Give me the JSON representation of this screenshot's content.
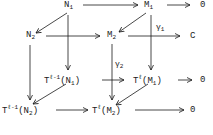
{
  "diagram": {
    "type": "commutative-cube",
    "nodes": {
      "N1": {
        "base": "N",
        "sub": "1"
      },
      "M1": {
        "base": "M",
        "sub": "1"
      },
      "Z1": {
        "base": "0"
      },
      "N2": {
        "base": "N",
        "sub": "2"
      },
      "M2": {
        "base": "M",
        "sub": "2"
      },
      "Z2": {
        "base": "C"
      },
      "TN1": {
        "base": "T",
        "sup": "ℓ-1",
        "arg": "(N",
        "argsub": "1",
        "close": ")"
      },
      "TM1": {
        "base": "T",
        "sup": "ℓ",
        "arg": "(M",
        "argsub": "1",
        "close": ")"
      },
      "Z3": {
        "base": "0"
      },
      "TN2": {
        "base": "T",
        "sup": "ℓ-1",
        "arg": "(N",
        "argsub": "2",
        "close": ")"
      },
      "TM2": {
        "base": "T",
        "sup": "ℓ",
        "arg": "(M",
        "argsub": "2",
        "close": ")"
      },
      "Z4": {
        "base": "0"
      }
    },
    "labels": {
      "gamma1": {
        "base": "γ",
        "sub": "1"
      },
      "gamma2": {
        "base": "γ",
        "sub": "2"
      }
    },
    "edges": [
      {
        "from": "N1",
        "to": "M1"
      },
      {
        "from": "M1",
        "to": "Z1"
      },
      {
        "from": "N1",
        "to": "N2"
      },
      {
        "from": "M1",
        "to": "M2"
      },
      {
        "from": "N2",
        "to": "M2"
      },
      {
        "from": "M2",
        "to": "Z2",
        "label": "gamma1"
      },
      {
        "from": "N1",
        "to": "TN1"
      },
      {
        "from": "M1",
        "to": "TM1"
      },
      {
        "from": "N2",
        "to": "TN2"
      },
      {
        "from": "M2",
        "to": "TM2",
        "label": "gamma2"
      },
      {
        "from": "TN1",
        "to": "TM1"
      },
      {
        "from": "TM1",
        "to": "Z3"
      },
      {
        "from": "TN1",
        "to": "TN2"
      },
      {
        "from": "TM1",
        "to": "TM2"
      },
      {
        "from": "TN2",
        "to": "TM2"
      },
      {
        "from": "TM2",
        "to": "Z4"
      }
    ]
  }
}
